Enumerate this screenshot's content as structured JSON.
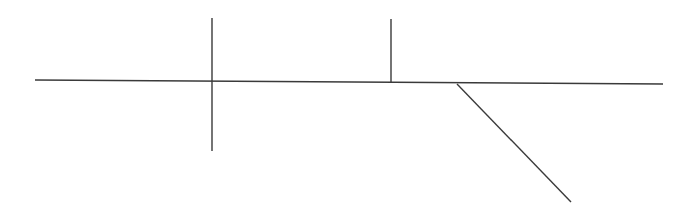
{
  "diagram": {
    "background": "#ffffff",
    "stroke_color": "#3a3a3a",
    "stroke_width": 1.4,
    "lines": [
      {
        "id": "main-horizontal-line",
        "x1": 35,
        "y1": 80,
        "x2": 663,
        "y2": 84
      },
      {
        "id": "vertical-line-crossing",
        "x1": 212,
        "y1": 18,
        "x2": 212,
        "y2": 151
      },
      {
        "id": "vertical-line-upper",
        "x1": 391,
        "y1": 19,
        "x2": 391,
        "y2": 82
      },
      {
        "id": "diagonal-line",
        "x1": 457,
        "y1": 84,
        "x2": 571,
        "y2": 202
      }
    ]
  }
}
